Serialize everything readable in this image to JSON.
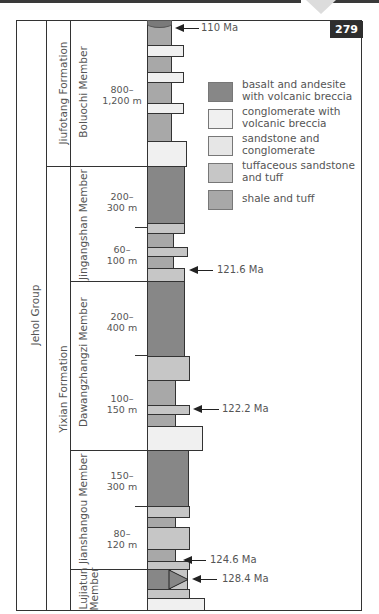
{
  "page": {
    "number": "279"
  },
  "units": {
    "group": "Jehol Group",
    "formations": [
      {
        "name": "Jiufotang Formation"
      },
      {
        "name": "Yixian Formation"
      }
    ],
    "members": [
      {
        "name": "Boluochi Member",
        "thickness": [
          "800–",
          "1,200 m"
        ]
      },
      {
        "name": "Jingangshan Member",
        "thickness_upper": [
          "200–",
          "300 m"
        ],
        "thickness_lower": [
          "60–",
          "100 m"
        ]
      },
      {
        "name": "Dawangzhangzi Member",
        "thickness_upper": [
          "200–",
          "400 m"
        ],
        "thickness_lower": [
          "100–",
          "150 m"
        ]
      },
      {
        "name": "Jianshangou Member",
        "thickness_upper": [
          "150–",
          "300 m"
        ],
        "thickness_lower": [
          "80–",
          "120 m"
        ]
      },
      {
        "name_line1": "Lujiatun",
        "name_line2": "Member"
      }
    ]
  },
  "ages": [
    {
      "label": "110 Ma"
    },
    {
      "label": "121.6 Ma"
    },
    {
      "label": "122.2 Ma"
    },
    {
      "label": "124.6 Ma"
    },
    {
      "label": "128.4 Ma"
    }
  ],
  "legend": [
    {
      "label": "basalt and andesite with volcanic breccia",
      "color": "#878787"
    },
    {
      "label": "conglomerate with volcanic breccia",
      "color": "#f0f0f0"
    },
    {
      "label": "sandstone and conglomerate",
      "color": "#e6e6e6"
    },
    {
      "label": "tuffaceous sandstone and tuff",
      "color": "#c6c6c6"
    },
    {
      "label": "shale and tuff",
      "color": "#a8a8a8"
    }
  ]
}
